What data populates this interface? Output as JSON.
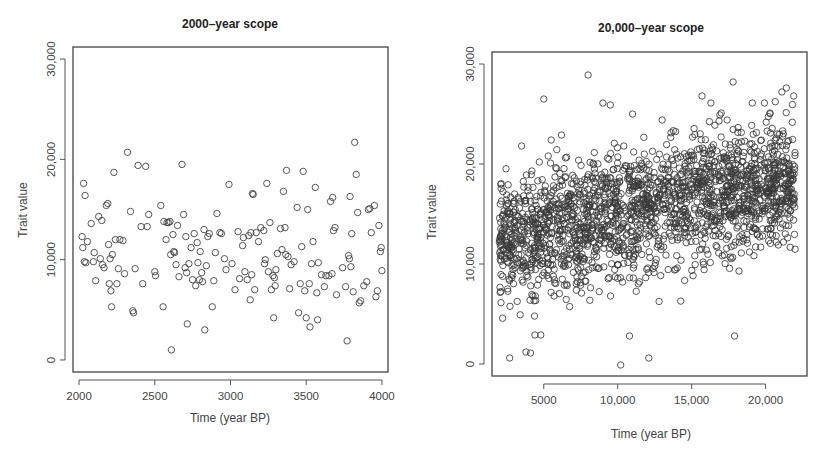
{
  "chart_data": [
    {
      "type": "scatter",
      "title": "2000–year scope",
      "xlabel": "Time (year BP)",
      "ylabel": "Trait value",
      "xlim": [
        1960,
        4040
      ],
      "ylim": [
        -1200,
        31200
      ],
      "xticks": [
        2000,
        2500,
        3000,
        3500,
        4000
      ],
      "xtick_labels": [
        "2000",
        "2500",
        "3000",
        "3500",
        "4000"
      ],
      "yticks": [
        0,
        10000,
        20000,
        30000
      ],
      "ytick_labels": [
        "0",
        "10,000",
        "20,000",
        "30,000"
      ],
      "grid": false,
      "legend": null,
      "marker": "open-circle",
      "frame": {
        "left": 73,
        "top": 47,
        "right": 388,
        "bottom": 372
      },
      "points": [
        [
          2020,
          12300
        ],
        [
          2025,
          11200
        ],
        [
          2030,
          17600
        ],
        [
          2035,
          9800
        ],
        [
          2040,
          16400
        ],
        [
          2045,
          9700
        ],
        [
          2055,
          11800
        ],
        [
          2080,
          13600
        ],
        [
          2095,
          9800
        ],
        [
          2100,
          10700
        ],
        [
          2110,
          7900
        ],
        [
          2130,
          14300
        ],
        [
          2140,
          10100
        ],
        [
          2150,
          13900
        ],
        [
          2155,
          9500
        ],
        [
          2165,
          9200
        ],
        [
          2180,
          15400
        ],
        [
          2190,
          15600
        ],
        [
          2195,
          11500
        ],
        [
          2200,
          7600
        ],
        [
          2205,
          10100
        ],
        [
          2210,
          6900
        ],
        [
          2215,
          5300
        ],
        [
          2220,
          10500
        ],
        [
          2230,
          18700
        ],
        [
          2240,
          12000
        ],
        [
          2250,
          7600
        ],
        [
          2260,
          9100
        ],
        [
          2270,
          12000
        ],
        [
          2290,
          11900
        ],
        [
          2300,
          8600
        ],
        [
          2320,
          20700
        ],
        [
          2340,
          14800
        ],
        [
          2355,
          4900
        ],
        [
          2360,
          4700
        ],
        [
          2370,
          9100
        ],
        [
          2390,
          19400
        ],
        [
          2410,
          13300
        ],
        [
          2420,
          7600
        ],
        [
          2440,
          19300
        ],
        [
          2450,
          13300
        ],
        [
          2460,
          14500
        ],
        [
          2500,
          8800
        ],
        [
          2505,
          8400
        ],
        [
          2540,
          15400
        ],
        [
          2555,
          5300
        ],
        [
          2560,
          13800
        ],
        [
          2575,
          12000
        ],
        [
          2580,
          13700
        ],
        [
          2590,
          13700
        ],
        [
          2600,
          13800
        ],
        [
          2605,
          10500
        ],
        [
          2610,
          1000
        ],
        [
          2620,
          12500
        ],
        [
          2625,
          10800
        ],
        [
          2630,
          10700
        ],
        [
          2640,
          9500
        ],
        [
          2650,
          13400
        ],
        [
          2660,
          8300
        ],
        [
          2680,
          19500
        ],
        [
          2690,
          14500
        ],
        [
          2700,
          9200
        ],
        [
          2705,
          12300
        ],
        [
          2710,
          8700
        ],
        [
          2715,
          3600
        ],
        [
          2725,
          9600
        ],
        [
          2740,
          11200
        ],
        [
          2750,
          8000
        ],
        [
          2760,
          12600
        ],
        [
          2770,
          7400
        ],
        [
          2780,
          11700
        ],
        [
          2785,
          9700
        ],
        [
          2795,
          8000
        ],
        [
          2800,
          10800
        ],
        [
          2810,
          8700
        ],
        [
          2815,
          7800
        ],
        [
          2825,
          13000
        ],
        [
          2830,
          3000
        ],
        [
          2840,
          9400
        ],
        [
          2850,
          12300
        ],
        [
          2860,
          12600
        ],
        [
          2880,
          5300
        ],
        [
          2890,
          7900
        ],
        [
          2900,
          10700
        ],
        [
          2910,
          14600
        ],
        [
          2930,
          12700
        ],
        [
          2940,
          12600
        ],
        [
          2960,
          10100
        ],
        [
          2970,
          9000
        ],
        [
          2990,
          17500
        ],
        [
          3010,
          9600
        ],
        [
          3030,
          7000
        ],
        [
          3050,
          12800
        ],
        [
          3060,
          8100
        ],
        [
          3080,
          11400
        ],
        [
          3085,
          12200
        ],
        [
          3095,
          8800
        ],
        [
          3110,
          8000
        ],
        [
          3120,
          12400
        ],
        [
          3130,
          6000
        ],
        [
          3135,
          12700
        ],
        [
          3140,
          8500
        ],
        [
          3145,
          16600
        ],
        [
          3150,
          16500
        ],
        [
          3160,
          7000
        ],
        [
          3170,
          12700
        ],
        [
          3185,
          11800
        ],
        [
          3200,
          13200
        ],
        [
          3220,
          12900
        ],
        [
          3225,
          9600
        ],
        [
          3230,
          10000
        ],
        [
          3240,
          17600
        ],
        [
          3250,
          8800
        ],
        [
          3260,
          13700
        ],
        [
          3270,
          7000
        ],
        [
          3280,
          8400
        ],
        [
          3285,
          4200
        ],
        [
          3290,
          8200
        ],
        [
          3295,
          7400
        ],
        [
          3300,
          9000
        ],
        [
          3310,
          10600
        ],
        [
          3330,
          13100
        ],
        [
          3340,
          11000
        ],
        [
          3350,
          16800
        ],
        [
          3360,
          13200
        ],
        [
          3365,
          10500
        ],
        [
          3370,
          18900
        ],
        [
          3380,
          10300
        ],
        [
          3390,
          7100
        ],
        [
          3400,
          9500
        ],
        [
          3420,
          9800
        ],
        [
          3440,
          15200
        ],
        [
          3450,
          4700
        ],
        [
          3460,
          7600
        ],
        [
          3470,
          11300
        ],
        [
          3480,
          18800
        ],
        [
          3490,
          6900
        ],
        [
          3500,
          4200
        ],
        [
          3510,
          15000
        ],
        [
          3520,
          7600
        ],
        [
          3525,
          3300
        ],
        [
          3535,
          9600
        ],
        [
          3545,
          11800
        ],
        [
          3560,
          17200
        ],
        [
          3570,
          6700
        ],
        [
          3575,
          4000
        ],
        [
          3580,
          9700
        ],
        [
          3600,
          8500
        ],
        [
          3620,
          7300
        ],
        [
          3630,
          8400
        ],
        [
          3650,
          8400
        ],
        [
          3660,
          15800
        ],
        [
          3670,
          8600
        ],
        [
          3675,
          16200
        ],
        [
          3680,
          12900
        ],
        [
          3690,
          13200
        ],
        [
          3700,
          6500
        ],
        [
          3740,
          9200
        ],
        [
          3760,
          7300
        ],
        [
          3770,
          1900
        ],
        [
          3780,
          10400
        ],
        [
          3785,
          10100
        ],
        [
          3790,
          16300
        ],
        [
          3795,
          9300
        ],
        [
          3800,
          12600
        ],
        [
          3810,
          6800
        ],
        [
          3820,
          21700
        ],
        [
          3830,
          18500
        ],
        [
          3840,
          14700
        ],
        [
          3850,
          5700
        ],
        [
          3860,
          5900
        ],
        [
          3880,
          7400
        ],
        [
          3900,
          7800
        ],
        [
          3910,
          15000
        ],
        [
          3920,
          15100
        ],
        [
          3930,
          12700
        ],
        [
          3950,
          15400
        ],
        [
          3960,
          6300
        ],
        [
          3970,
          6900
        ],
        [
          3980,
          13400
        ],
        [
          3990,
          10800
        ],
        [
          3995,
          11200
        ],
        [
          4000,
          8900
        ]
      ]
    },
    {
      "type": "scatter",
      "title": "20,000–year scope",
      "xlabel": "Time (year BP)",
      "ylabel": "Trait value",
      "xlim": [
        1500,
        22800
      ],
      "ylim": [
        -1200,
        31200
      ],
      "xticks": [
        5000,
        10000,
        15000,
        20000
      ],
      "xtick_labels": [
        "5000",
        "10,000",
        "15,000",
        "20,000"
      ],
      "yticks": [
        0,
        10000,
        20000,
        30000
      ],
      "ytick_labels": [
        "0",
        "10,000",
        "20,000",
        "30,000"
      ],
      "grid": false,
      "legend": null,
      "marker": "open-circle",
      "frame": {
        "left": 492,
        "top": 52,
        "right": 807,
        "bottom": 376
      },
      "x_range_data": [
        2000,
        22000
      ],
      "n_points": 2000,
      "trend": {
        "intercept_at_2000": 12500,
        "slope_per_year": 0.3,
        "sd": 4300
      },
      "outliers": [
        [
          2700,
          600
        ],
        [
          3800,
          1200
        ],
        [
          4100,
          1100
        ],
        [
          10200,
          -100
        ],
        [
          12100,
          600
        ],
        [
          4400,
          2900
        ],
        [
          4800,
          2900
        ],
        [
          10800,
          2800
        ],
        [
          17900,
          2800
        ],
        [
          8000,
          28900
        ],
        [
          5000,
          26500
        ],
        [
          9000,
          26100
        ],
        [
          9500,
          25900
        ],
        [
          11000,
          25000
        ],
        [
          13000,
          24400
        ],
        [
          15700,
          26800
        ],
        [
          16300,
          26100
        ],
        [
          17000,
          25100
        ],
        [
          17400,
          24400
        ],
        [
          17800,
          28200
        ],
        [
          21100,
          27200
        ],
        [
          21400,
          27600
        ],
        [
          21900,
          26800
        ],
        [
          19100,
          26100
        ],
        [
          20300,
          25100
        ],
        [
          3500,
          21800
        ],
        [
          4200,
          19300
        ],
        [
          5500,
          22400
        ],
        [
          6200,
          22900
        ],
        [
          5300,
          20800
        ],
        [
          4700,
          20200
        ]
      ]
    }
  ]
}
